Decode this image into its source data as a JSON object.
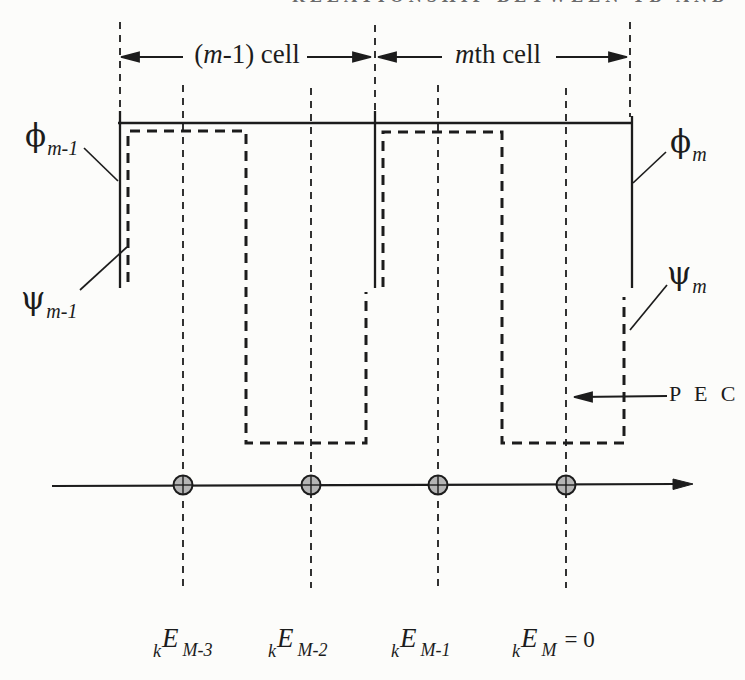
{
  "figure": {
    "clipped_header_text": "RELATIONSHIP BETWEEN TD AND FD",
    "cells": {
      "left_label": {
        "pre": "(",
        "italic": "m",
        "rest": "-1) cell"
      },
      "right_label": {
        "italic": "m",
        "rest": "th cell"
      }
    },
    "function_labels": {
      "phi_prev": {
        "symbol": "ϕ",
        "sub": "m-1"
      },
      "psi_prev": {
        "symbol": "ψ",
        "sub": "m-1"
      },
      "phi_m": {
        "symbol": "ϕ",
        "sub": "m"
      },
      "psi_m": {
        "symbol": "ψ",
        "sub": "m"
      }
    },
    "pec_label": "P E C",
    "node_labels": [
      {
        "presub": "k",
        "main": "E",
        "sub": "M-3",
        "suffix": ""
      },
      {
        "presub": "k",
        "main": "E",
        "sub": "M-2",
        "suffix": ""
      },
      {
        "presub": "k",
        "main": "E",
        "sub": "M-1",
        "suffix": ""
      },
      {
        "presub": "k",
        "main": "E",
        "sub": "M",
        "suffix": "= 0"
      }
    ],
    "colors": {
      "ink": "#1c1c1c",
      "paper": "#fcfcfa",
      "node_fill": "#b5b5b5"
    }
  }
}
